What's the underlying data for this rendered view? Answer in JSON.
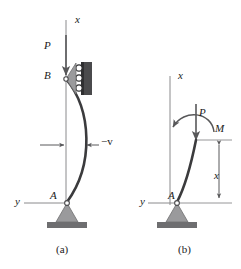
{
  "figure": {
    "subfigures": [
      {
        "id": "a",
        "caption": "(a)",
        "labels": {
          "axis_x": "x",
          "axis_y": "y",
          "load_P": "P",
          "node_top": "B",
          "node_bottom": "A",
          "deflection": "−v"
        },
        "elements": {
          "support_top": "roller-support",
          "support_bottom": "pin-support",
          "member": "buckled-column-curve",
          "dimension": "deflection-dimension-arrows"
        }
      },
      {
        "id": "b",
        "caption": "(b)",
        "labels": {
          "axis_x": "x",
          "axis_y": "y",
          "load_P": "P",
          "moment_M": "M",
          "node_bottom": "A",
          "dimension_x": "x"
        },
        "elements": {
          "support_bottom": "pin-support",
          "member": "buckled-column-segment",
          "moment_arrow": "counterclockwise-curved-arrow",
          "dimension": "height-dimension-arrow"
        }
      }
    ],
    "colors": {
      "line": "#58585a",
      "member": "#3b3b3d",
      "support_fill": "#9a9a9c",
      "support_base": "#6e6e70",
      "roller_wall": "#4a4a4c",
      "text": "#1a1a1a",
      "background": "#ffffff"
    }
  }
}
